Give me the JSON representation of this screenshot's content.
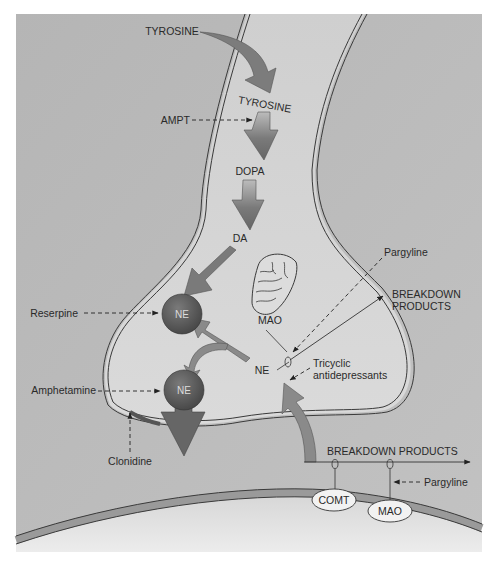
{
  "diagram": {
    "colors": {
      "background": "#ffffff",
      "panel": "#b9b9b9",
      "neuron_fill": "#d4d4d4",
      "postsynaptic_fill": "#dedede",
      "membrane_line": "#3a3a3a",
      "membrane_band": "#9a9a9a",
      "arrow_fill": "#7a7a7a",
      "vesicle_fill": "#5c5c5c",
      "text": "#2a2a2a"
    },
    "synthesis_pathway": {
      "tyrosine_outside": "TYROSINE",
      "tyrosine_inside": "TYROSINE",
      "dopa": "DOPA",
      "da": "DA"
    },
    "vesicles": [
      {
        "label": "NE"
      },
      {
        "label": "NE"
      }
    ],
    "mitochondrion": {
      "enzyme_label": "MAO"
    },
    "cytoplasmic_ne": "NE",
    "breakdown_inside": {
      "line1": "BREAKDOWN",
      "line2": "PRODUCTS"
    },
    "breakdown_cleft": "BREAKDOWN PRODUCTS",
    "postsynaptic_enzymes": [
      {
        "label": "COMT"
      },
      {
        "label": "MAO"
      }
    ],
    "drugs": {
      "ampt": "AMPT",
      "reserpine": "Reserpine",
      "amphetamine": "Amphetamine",
      "clonidine": "Clonidine",
      "pargyline_inside": "Pargyline",
      "tricyclic_line1": "Tricyclic",
      "tricyclic_line2": "antidepressants",
      "pargyline_cleft": "Pargyline"
    }
  }
}
